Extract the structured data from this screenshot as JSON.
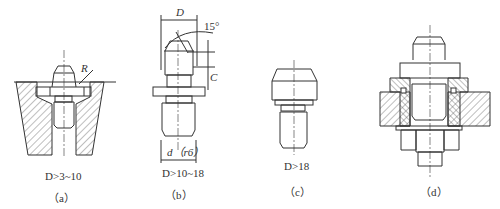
{
  "figure": {
    "type": "engineering drawing",
    "line_color": "#333333",
    "background": "#ffffff"
  },
  "panels": [
    {
      "id": "a",
      "caption": "（a）",
      "condition": "D>3~10",
      "callouts": [
        "R"
      ]
    },
    {
      "id": "b",
      "caption": "（b）",
      "condition": "D>10~18",
      "callouts": [
        "D",
        "15°",
        "C",
        "d（r6）"
      ]
    },
    {
      "id": "c",
      "caption": "（c）",
      "condition": "D>18",
      "callouts": []
    },
    {
      "id": "d",
      "caption": "（d）",
      "condition": "",
      "callouts": []
    }
  ]
}
